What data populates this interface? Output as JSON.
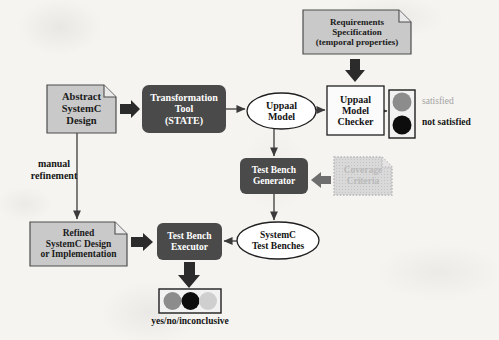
{
  "diagram": {
    "background_color": "#f5f4f1",
    "colors": {
      "dark_box": "#4a4a4a",
      "document_fill": "#c9c9c9",
      "document_stroke": "#4d4d4d",
      "faded_fill": "#d5d5d5",
      "faded_stroke": "#bdbdbd",
      "faded_text": "#b9b9b9",
      "white_fill": "#ffffff",
      "line": "#3b3b3b",
      "indicator_gray": "#8c8c8c",
      "indicator_black": "#0d0d0d",
      "indicator_light": "#cfcfcf"
    },
    "nodes": [
      {
        "id": "abstract-systemc-design",
        "name": "abstract-systemc-design-node",
        "shape": "document",
        "label": "Abstract\nSystemC\nDesign",
        "x": 47,
        "y": 85,
        "w": 69,
        "h": 48,
        "font_size": 10.5
      },
      {
        "id": "transformation-tool",
        "name": "transformation-tool-node",
        "shape": "rounded-dark",
        "label": "Transformation\nTool\n(STATE)",
        "x": 142,
        "y": 85,
        "w": 84,
        "h": 48,
        "font_size": 10
      },
      {
        "id": "uppaal-model",
        "name": "uppaal-model-node",
        "shape": "ellipse",
        "label": "Uppaal\nModel",
        "x": 247,
        "y": 93,
        "w": 69,
        "h": 36,
        "font_size": 10
      },
      {
        "id": "uppaal-model-checker",
        "name": "uppaal-model-checker-node",
        "shape": "rect",
        "label": "Uppaal\nModel\nChecker",
        "x": 327,
        "y": 86,
        "w": 57,
        "h": 49,
        "font_size": 10
      },
      {
        "id": "requirements-specification",
        "name": "requirements-specification-node",
        "shape": "document",
        "label": "Requirements\nSpecification\n(temporal properties)",
        "x": 303,
        "y": 10,
        "w": 108,
        "h": 44,
        "font_size": 9
      },
      {
        "id": "test-bench-generator",
        "name": "test-bench-generator-node",
        "shape": "rounded-dark",
        "label": "Test Bench\nGenerator",
        "x": 240,
        "y": 158,
        "w": 68,
        "h": 36,
        "font_size": 9.5
      },
      {
        "id": "coverage-criteria",
        "name": "coverage-criteria-node",
        "shape": "document-faded",
        "label": "Coverage\nCriteria",
        "x": 334,
        "y": 157,
        "w": 58,
        "h": 38,
        "font_size": 9.5
      },
      {
        "id": "systemc-test-benches",
        "name": "systemc-test-benches-node",
        "shape": "ellipse",
        "label": "SystemC\nTest Benches",
        "x": 237,
        "y": 222,
        "w": 82,
        "h": 37,
        "font_size": 9.5
      },
      {
        "id": "refined-systemc-design",
        "name": "refined-systemc-design-node",
        "shape": "document",
        "label": "Refined\nSystemC Design\nor Implementation",
        "x": 30,
        "y": 222,
        "w": 97,
        "h": 44,
        "font_size": 9.5
      },
      {
        "id": "test-bench-executor",
        "name": "test-bench-executor-node",
        "shape": "rounded-dark",
        "label": "Test Bench\nExecutor",
        "x": 157,
        "y": 223,
        "w": 65,
        "h": 37,
        "font_size": 9.5
      }
    ],
    "annotations": [
      {
        "id": "manual-refinement",
        "name": "manual-refinement-label",
        "text": "manual\nrefinement",
        "x": 18,
        "y": 158,
        "w": 72,
        "font_size": 10,
        "style": "plain"
      },
      {
        "id": "satisfied",
        "name": "satisfied-label",
        "text": "satisfied",
        "x": 422,
        "y": 96,
        "w": 70,
        "font_size": 9.5,
        "style": "gray"
      },
      {
        "id": "not-satisfied",
        "name": "not-satisfied-label",
        "text": "not satisfied",
        "x": 422,
        "y": 117,
        "w": 74,
        "font_size": 9.5,
        "style": "plain"
      },
      {
        "id": "yes-no-inconclusive",
        "name": "yes-no-inconclusive-label",
        "text": "yes/no/inconclusive",
        "x": 130,
        "y": 316,
        "w": 120,
        "font_size": 9.5,
        "style": "plain"
      }
    ],
    "indicators": [
      {
        "id": "model-checker-result",
        "name": "model-checker-result-indicator",
        "orientation": "vertical",
        "x": 389,
        "y": 90,
        "w": 26,
        "h": 48,
        "lights": [
          {
            "name": "satisfied-light",
            "color": "#8c8c8c"
          },
          {
            "name": "not-satisfied-light",
            "color": "#0d0d0d"
          }
        ]
      },
      {
        "id": "executor-result",
        "name": "executor-result-indicator",
        "orientation": "horizontal",
        "x": 159,
        "y": 289,
        "w": 62,
        "h": 24,
        "lights": [
          {
            "name": "yes-light",
            "color": "#8c8c8c"
          },
          {
            "name": "no-light",
            "color": "#0d0d0d"
          },
          {
            "name": "inconclusive-light",
            "color": "#cfcfcf"
          }
        ]
      }
    ],
    "edges": [
      {
        "id": "design-to-tool",
        "name": "edge-design-to-transformation-tool",
        "style": "block-arrow",
        "direction": "right"
      },
      {
        "id": "tool-to-model",
        "name": "edge-transformation-tool-to-uppaal-model",
        "style": "thin-arrow",
        "direction": "right"
      },
      {
        "id": "model-to-checker",
        "name": "edge-uppaal-model-to-checker",
        "style": "thin-arrow",
        "direction": "right"
      },
      {
        "id": "requirements-to-checker",
        "name": "edge-requirements-to-checker",
        "style": "block-arrow",
        "direction": "down"
      },
      {
        "id": "checker-to-result",
        "name": "edge-checker-to-result-indicator",
        "style": "thin-arrow",
        "direction": "right"
      },
      {
        "id": "model-to-generator",
        "name": "edge-uppaal-model-to-test-bench-generator",
        "style": "thin-arrow",
        "direction": "down"
      },
      {
        "id": "coverage-to-generator",
        "name": "edge-coverage-criteria-to-generator",
        "style": "block-arrow",
        "direction": "left"
      },
      {
        "id": "generator-to-benches",
        "name": "edge-generator-to-test-benches",
        "style": "thin-arrow",
        "direction": "down"
      },
      {
        "id": "benches-to-executor",
        "name": "edge-test-benches-to-executor",
        "style": "thin-arrow",
        "direction": "left"
      },
      {
        "id": "refined-to-executor",
        "name": "edge-refined-design-to-executor",
        "style": "block-arrow",
        "direction": "right"
      },
      {
        "id": "executor-to-result",
        "name": "edge-executor-to-result-indicator",
        "style": "block-arrow",
        "direction": "down"
      },
      {
        "id": "design-to-refined",
        "name": "edge-abstract-design-to-refined-design",
        "style": "thin-arrow",
        "direction": "down"
      }
    ]
  }
}
